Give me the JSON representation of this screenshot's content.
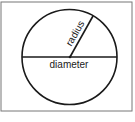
{
  "diagram": {
    "labels": {
      "radius": "radius",
      "diameter": "diameter"
    },
    "colors": {
      "stroke": "#1a1a1a",
      "frame": "#555555",
      "background": "#ffffff"
    }
  }
}
